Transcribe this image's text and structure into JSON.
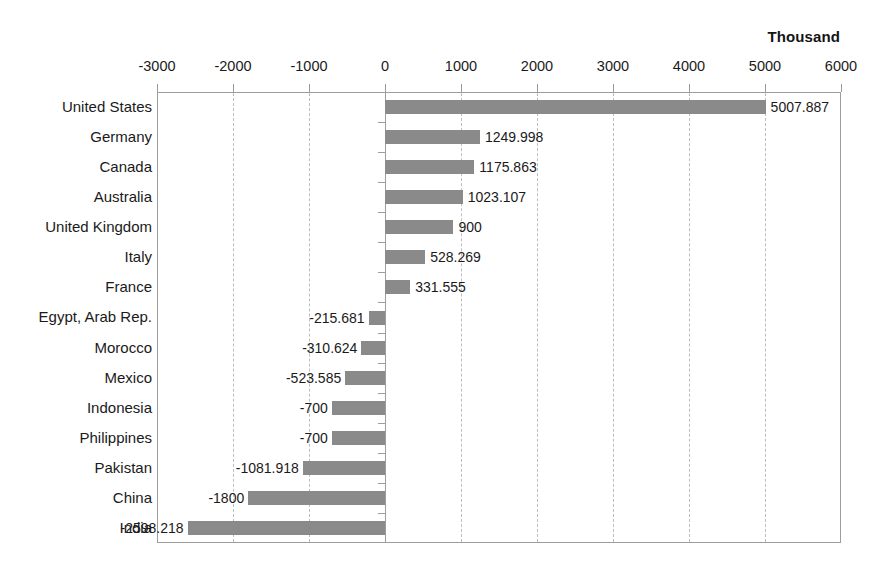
{
  "chart_data": {
    "type": "bar",
    "orientation": "horizontal",
    "title": "",
    "unit_label": "Thousand",
    "xlabel": "",
    "ylabel": "",
    "xlim": [
      -3000,
      6000
    ],
    "xticks": [
      -3000,
      -2000,
      -1000,
      0,
      1000,
      2000,
      3000,
      4000,
      5000,
      6000
    ],
    "xtick_labels": [
      "-3000",
      "-2000",
      "-1000",
      "0",
      "1000",
      "2000",
      "3000",
      "4000",
      "5000",
      "6000"
    ],
    "grid": true,
    "grid_style": "dashed-vertical",
    "legend": null,
    "bar_color": "#8a8a8a",
    "categories": [
      "United States",
      "Germany",
      "Canada",
      "Australia",
      "United Kingdom",
      "Italy",
      "France",
      "Egypt, Arab Rep.",
      "Morocco",
      "Mexico",
      "Indonesia",
      "Philippines",
      "Pakistan",
      "China",
      "India"
    ],
    "values": [
      5007.887,
      1249.998,
      1175.863,
      1023.107,
      900,
      528.269,
      331.555,
      -215.681,
      -310.624,
      -523.585,
      -700,
      -700,
      -1081.918,
      -1800,
      -2598.218
    ],
    "value_labels": [
      "5007.887",
      "1249.998",
      "1175.863",
      "1023.107",
      "900",
      "528.269",
      "331.555",
      "-215.681",
      "-310.624",
      "-523.585",
      "-700",
      "-700",
      "-1081.918",
      "-1800",
      "-2598.218"
    ]
  }
}
